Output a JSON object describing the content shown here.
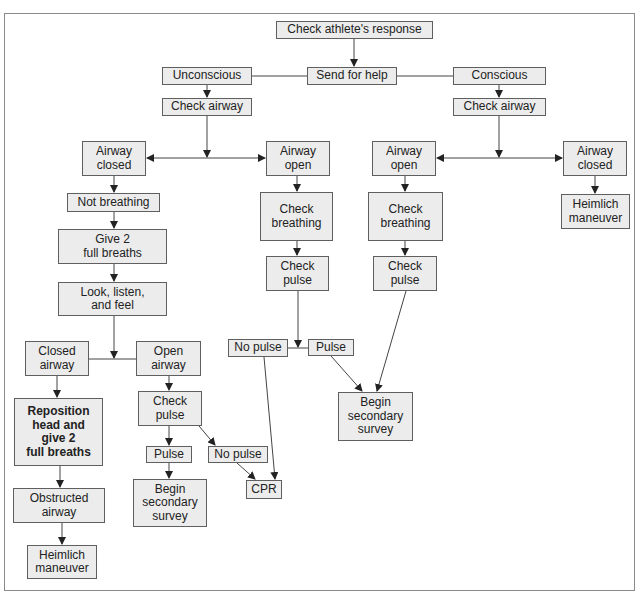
{
  "diagram": {
    "type": "flowchart"
  },
  "nodes": {
    "check_response": "Check athlete's response",
    "send_help": "Send for help",
    "unconscious": "Unconscious",
    "conscious": "Conscious",
    "check_airway_u": "Check airway",
    "check_airway_c": "Check airway",
    "airway_closed_u": "Airway\nclosed",
    "airway_open_u": "Airway\nopen",
    "airway_open_c": "Airway\nopen",
    "airway_closed_c": "Airway\nclosed",
    "not_breathing": "Not breathing",
    "check_breathing_u": "Check\nbreathing",
    "check_breathing_c": "Check\nbreathing",
    "heimlich_c": "Heimlich\nmaneuver",
    "give_breaths": "Give 2\nfull breaths",
    "check_pulse_u": "Check\npulse",
    "check_pulse_c": "Check\npulse",
    "look_listen": "Look, listen,\nand feel",
    "no_pulse_u": "No pulse",
    "pulse_u": "Pulse",
    "closed_airway": "Closed\nairway",
    "open_airway": "Open\nairway",
    "begin_survey_c": "Begin\nsecondary\nsurvey",
    "reposition": "Reposition\nhead and\ngive 2\nfull breaths",
    "check_pulse_oa": "Check\npulse",
    "pulse_oa": "Pulse",
    "no_pulse_oa": "No pulse",
    "begin_survey_oa": "Begin\nsecondary\nsurvey",
    "cpr": "CPR",
    "obstructed": "Obstructed\nairway",
    "heimlich_u": "Heimlich\nmaneuver"
  },
  "edges": [
    {
      "from": "check_response",
      "to": "send_help"
    },
    {
      "from": "send_help",
      "to": "unconscious",
      "arrow": false
    },
    {
      "from": "send_help",
      "to": "conscious",
      "arrow": false
    },
    {
      "from": "unconscious",
      "to": "check_airway_u"
    },
    {
      "from": "conscious",
      "to": "check_airway_c"
    },
    {
      "from": "check_airway_u",
      "to": "airway_closed_u"
    },
    {
      "from": "check_airway_u",
      "to": "airway_open_u"
    },
    {
      "from": "check_airway_c",
      "to": "airway_open_c"
    },
    {
      "from": "check_airway_c",
      "to": "airway_closed_c"
    },
    {
      "from": "airway_closed_u",
      "to": "not_breathing"
    },
    {
      "from": "not_breathing",
      "to": "give_breaths"
    },
    {
      "from": "give_breaths",
      "to": "look_listen"
    },
    {
      "from": "look_listen",
      "to": "closed_airway",
      "arrow": false
    },
    {
      "from": "look_listen",
      "to": "open_airway",
      "arrow": false
    },
    {
      "from": "closed_airway",
      "to": "reposition"
    },
    {
      "from": "reposition",
      "to": "obstructed"
    },
    {
      "from": "obstructed",
      "to": "heimlich_u"
    },
    {
      "from": "open_airway",
      "to": "check_pulse_oa"
    },
    {
      "from": "check_pulse_oa",
      "to": "pulse_oa"
    },
    {
      "from": "check_pulse_oa",
      "to": "no_pulse_oa"
    },
    {
      "from": "pulse_oa",
      "to": "begin_survey_oa"
    },
    {
      "from": "no_pulse_oa",
      "to": "cpr"
    },
    {
      "from": "airway_open_u",
      "to": "check_breathing_u"
    },
    {
      "from": "check_breathing_u",
      "to": "check_pulse_u"
    },
    {
      "from": "check_pulse_u",
      "to": "no_pulse_u",
      "arrow": false
    },
    {
      "from": "check_pulse_u",
      "to": "pulse_u",
      "arrow": false
    },
    {
      "from": "no_pulse_u",
      "to": "cpr"
    },
    {
      "from": "pulse_u",
      "to": "begin_survey_c"
    },
    {
      "from": "airway_open_c",
      "to": "check_breathing_c"
    },
    {
      "from": "check_breathing_c",
      "to": "check_pulse_c"
    },
    {
      "from": "check_pulse_c",
      "to": "begin_survey_c"
    },
    {
      "from": "airway_closed_c",
      "to": "heimlich_c"
    }
  ]
}
